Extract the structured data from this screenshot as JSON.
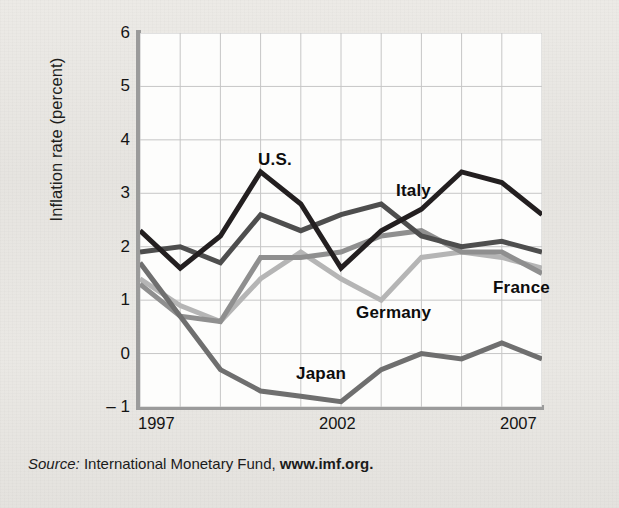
{
  "figure": {
    "ylabel": "Inflation rate (percent)",
    "source_prefix": "Source:",
    "source_body": "International Monetary Fund,",
    "source_url": "www.imf.org."
  },
  "chart_data": {
    "type": "line",
    "title": "",
    "xlabel": "",
    "ylabel": "Inflation rate (percent)",
    "xlim": [
      1997,
      2007
    ],
    "ylim": [
      -1,
      6
    ],
    "yticks": [
      6,
      5,
      4,
      3,
      2,
      1,
      0,
      -1
    ],
    "ytick_labels": [
      "6",
      "5",
      "4",
      "3",
      "2",
      "1",
      "0",
      "– 1"
    ],
    "xticks": [
      1997,
      2002,
      2007
    ],
    "xtick_labels": [
      "1997",
      "2002",
      "2007"
    ],
    "grid": true,
    "grid_x_every": 1,
    "grid_y_every": 1,
    "legend": "inline-annotations",
    "x": [
      1997,
      1998,
      1999,
      2000,
      2001,
      2002,
      2003,
      2004,
      2005,
      2006,
      2007
    ],
    "series": [
      {
        "name": "U.S.",
        "color": "#231f20",
        "values": [
          2.3,
          1.6,
          2.2,
          3.4,
          2.8,
          1.6,
          2.3,
          2.7,
          3.4,
          3.2,
          2.6
        ],
        "label_x": 258,
        "label_y": 150
      },
      {
        "name": "Italy",
        "color": "#4e4e4e",
        "values": [
          1.9,
          2.0,
          1.7,
          2.6,
          2.3,
          2.6,
          2.8,
          2.2,
          2.0,
          2.1,
          1.9
        ],
        "label_x": 396,
        "label_y": 181
      },
      {
        "name": "Germany",
        "color": "#b5b5b5",
        "values": [
          1.4,
          0.9,
          0.6,
          1.4,
          1.9,
          1.4,
          1.0,
          1.8,
          1.9,
          1.8,
          1.6
        ],
        "label_x": 356,
        "label_y": 303
      },
      {
        "name": "France",
        "color": "#8f8f8f",
        "values": [
          1.3,
          0.7,
          0.6,
          1.8,
          1.8,
          1.9,
          2.2,
          2.3,
          1.9,
          1.9,
          1.5
        ],
        "label_x": 493,
        "label_y": 278
      },
      {
        "name": "Japan",
        "color": "#6f6f6f",
        "values": [
          1.7,
          0.7,
          -0.3,
          -0.7,
          -0.8,
          -0.9,
          -0.3,
          0.0,
          -0.1,
          0.2,
          -0.1
        ],
        "label_x": 296,
        "label_y": 364
      }
    ]
  }
}
